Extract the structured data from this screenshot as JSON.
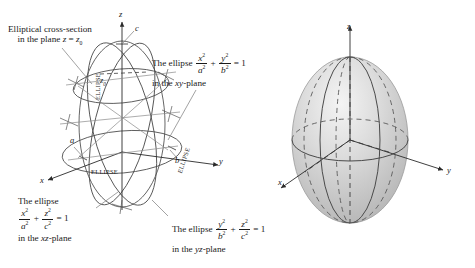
{
  "figure": {
    "ink_color": "#1a1a1a",
    "wire_color": "#4a4a4a",
    "solid_fill": "#cfcfcf",
    "solid_highlight": "#f2f2f2"
  },
  "left_diagram": {
    "name": "wireframe-ellipsoid",
    "axes": {
      "x": "x",
      "y": "y",
      "z": "z"
    },
    "intercepts": {
      "a": "a",
      "b": "b",
      "c": "c"
    },
    "plane_height_label": "z",
    "plane_height_sub": "0",
    "trace_labels": [
      "ELLIPSE",
      "ELLIPSE",
      "ELLIPSE"
    ],
    "annotations": {
      "cross_section": {
        "line1": "Elliptical cross-section",
        "line2_pre": "in the plane ",
        "line2_var": "z",
        "line2_eq": " = ",
        "line2_z": "z",
        "line2_sub": "0"
      },
      "xy_plane": {
        "lead": "The ellipse",
        "t1_num": "x",
        "t1_num_sup": "2",
        "t1_den": "a",
        "t1_den_sup": "2",
        "plus": "+",
        "t2_num": "y",
        "t2_num_sup": "2",
        "t2_den": "b",
        "t2_den_sup": "2",
        "equals": "= 1",
        "where_pre": "in the ",
        "where_plane": "xy",
        "where_post": "-plane"
      },
      "xz_plane": {
        "lead": "The ellipse",
        "t1_num": "x",
        "t1_num_sup": "2",
        "t1_den": "a",
        "t1_den_sup": "2",
        "plus": "+",
        "t2_num": "z",
        "t2_num_sup": "2",
        "t2_den": "c",
        "t2_den_sup": "2",
        "equals": "= 1",
        "where_pre": "in the ",
        "where_plane": "xz",
        "where_post": "-plane"
      },
      "yz_plane": {
        "lead": "The ellipse",
        "t1_num": "y",
        "t1_num_sup": "2",
        "t1_den": "b",
        "t1_den_sup": "2",
        "plus": "+",
        "t2_num": "z",
        "t2_num_sup": "2",
        "t2_den": "c",
        "t2_den_sup": "2",
        "equals": "= 1",
        "where_pre": "in the ",
        "where_plane": "yz",
        "where_post": "-plane"
      }
    }
  },
  "right_diagram": {
    "name": "shaded-ellipsoid",
    "axes": {
      "x": "x",
      "y": "y",
      "z": "z"
    }
  }
}
